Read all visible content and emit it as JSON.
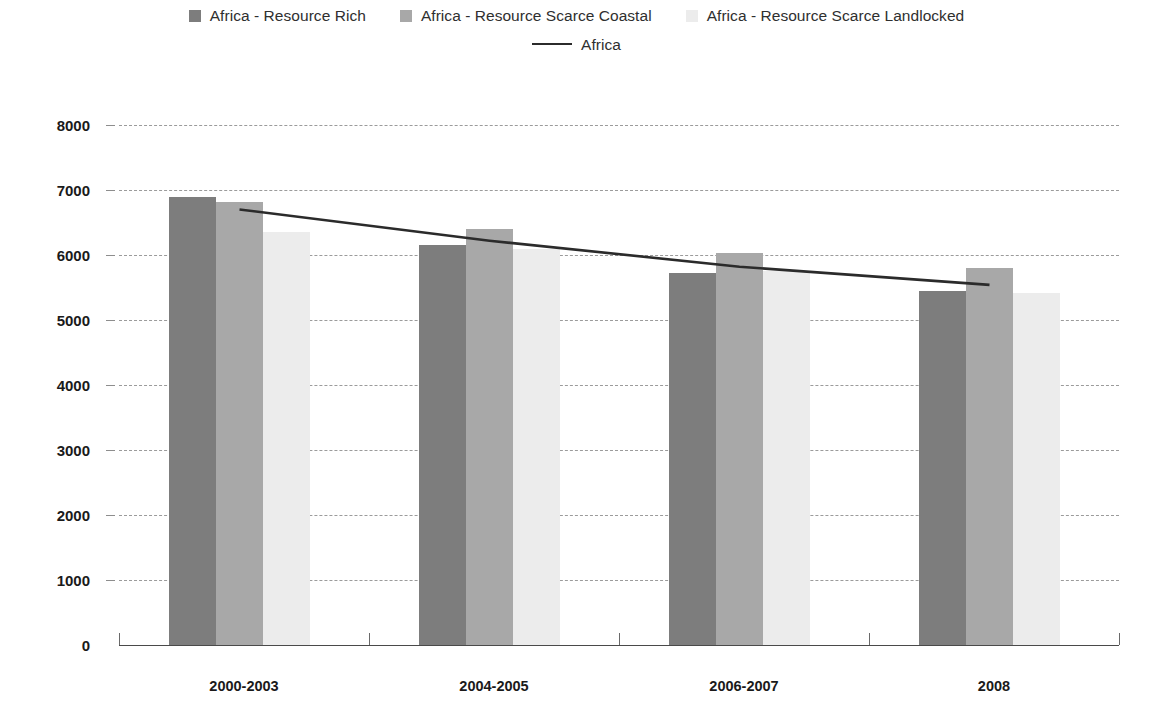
{
  "legend": {
    "row1": [
      {
        "label": "Africa - Resource Rich",
        "marker": "square-swatch-dark",
        "color": "#7d7d7d"
      },
      {
        "label": "Africa - Resource Scarce Coastal",
        "marker": "square-swatch-medium",
        "color": "#a8a8a8"
      },
      {
        "label": "Africa - Resource Scarce Landlocked",
        "marker": "square-swatch-light",
        "color": "#ececec"
      }
    ],
    "row2": [
      {
        "label": "Africa",
        "marker": "line-swatch",
        "color": "#2b2b2b"
      }
    ]
  },
  "chart_data": {
    "type": "bar",
    "title": "",
    "subtitle": "",
    "xlabel": "",
    "ylabel": "",
    "categories": [
      "2000-2003",
      "2004-2005",
      "2006-2007",
      "2008"
    ],
    "series": [
      {
        "name": "Africa - Resource Rich",
        "type": "bar",
        "color": "#7d7d7d",
        "values": [
          6900,
          6150,
          5730,
          5440
        ]
      },
      {
        "name": "Africa - Resource Scarce Coastal",
        "type": "bar",
        "color": "#a8a8a8",
        "values": [
          6810,
          6400,
          6030,
          5800
        ]
      },
      {
        "name": "Africa - Resource Scarce Landlocked",
        "type": "bar",
        "color": "#ececec",
        "values": [
          6350,
          6090,
          5760,
          5420
        ]
      },
      {
        "name": "Africa",
        "type": "line",
        "color": "#2b2b2b",
        "values": [
          6700,
          6220,
          5820,
          5540
        ]
      }
    ],
    "ylim": [
      0,
      8000
    ],
    "yticks": [
      0,
      1000,
      2000,
      3000,
      4000,
      5000,
      6000,
      7000,
      8000
    ],
    "ytick_labels": [
      "0",
      "1000",
      "2000",
      "3000",
      "4000",
      "5000",
      "6000",
      "7000",
      "8000"
    ],
    "grid": true,
    "grid_style": "dashed-horizontal",
    "legend_position": "top-center"
  }
}
